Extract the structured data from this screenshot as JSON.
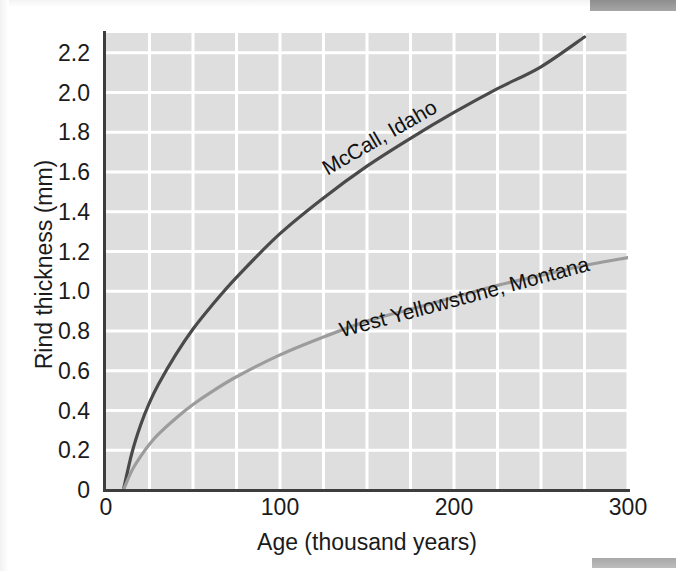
{
  "figure": {
    "background_color": "#ffffff",
    "plot_background_color": "#dedede",
    "gridline_color": "#ffffff",
    "axis_color": "#3d3d3d",
    "scan_bar_color": "#9a9a9a"
  },
  "axes": {
    "x_title": "Age (thousand years)",
    "y_title": "Rind thickness (mm)",
    "x_ticks": [
      "0",
      "100",
      "200",
      "300"
    ],
    "x_tick_values": [
      0,
      100,
      200,
      300
    ],
    "y_ticks": [
      "0",
      "0.2",
      "0.4",
      "0.6",
      "0.8",
      "1.0",
      "1.2",
      "1.4",
      "1.6",
      "1.8",
      "2.0",
      "2.2"
    ],
    "y_tick_values": [
      0,
      0.2,
      0.4,
      0.6,
      0.8,
      1.0,
      1.2,
      1.4,
      1.6,
      1.8,
      2.0,
      2.2
    ]
  },
  "annotations": {
    "mccall": "McCall, Idaho",
    "west_yellowstone": "West Yellowstone, Montana"
  },
  "chart_data": {
    "type": "line",
    "title": "",
    "xlabel": "Age (thousand years)",
    "ylabel": "Rind thickness (mm)",
    "xlim": [
      0,
      300
    ],
    "ylim": [
      0,
      2.3
    ],
    "grid": true,
    "grid_x_step": 25,
    "grid_y_step": 0.2,
    "legend": "inline-curve-labels",
    "series": [
      {
        "name": "McCall, Idaho",
        "color": "#4a4a4a",
        "line_width": 3.2,
        "x": [
          10,
          15,
          20,
          25,
          30,
          40,
          50,
          60,
          75,
          100,
          125,
          150,
          175,
          200,
          225,
          250,
          275
        ],
        "y": [
          0.0,
          0.19,
          0.33,
          0.44,
          0.53,
          0.68,
          0.81,
          0.92,
          1.07,
          1.29,
          1.47,
          1.63,
          1.77,
          1.9,
          2.02,
          2.13,
          2.28
        ]
      },
      {
        "name": "West Yellowstone, Montana",
        "color": "#9c9c9c",
        "line_width": 3.2,
        "x": [
          10,
          15,
          20,
          25,
          30,
          40,
          50,
          60,
          75,
          100,
          125,
          150,
          175,
          200,
          225,
          250,
          275,
          300
        ],
        "y": [
          0.0,
          0.1,
          0.17,
          0.23,
          0.28,
          0.36,
          0.43,
          0.49,
          0.57,
          0.68,
          0.77,
          0.85,
          0.91,
          0.97,
          1.03,
          1.08,
          1.13,
          1.17
        ]
      }
    ]
  }
}
